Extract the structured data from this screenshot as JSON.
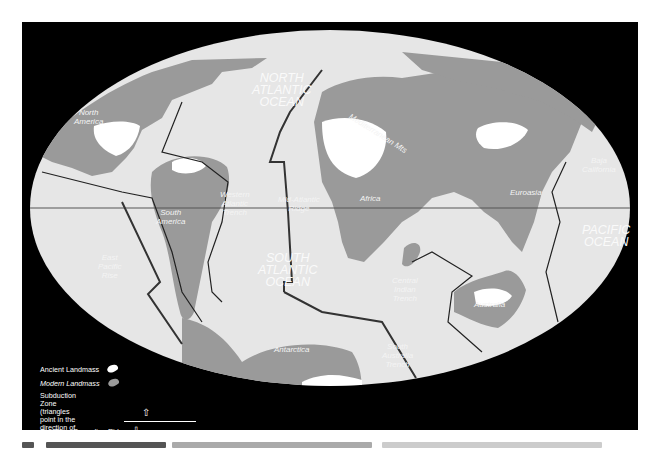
{
  "figure": {
    "type": "paleogeographic plate tectonic map",
    "colors": {
      "background": "#000000",
      "ocean": "#e6e6e6",
      "modern_landmass": "#9a9a9a",
      "ancient_landmass": "#ffffff",
      "lines": "#2a2a2a",
      "label_text": "#f4f4f4"
    }
  },
  "labels": {
    "north_america": "North\nAmerica",
    "south_america": "South\nAmerica",
    "africa": "Africa",
    "eurasia": "Euroasia",
    "mediterranean": "Mediterranean Mts",
    "baja_california": "Baja\nCalifornia",
    "australia": "Australia",
    "antarctica": "Antarctica",
    "western_atlantic_trench": "Western\nAtlantic\nTrench",
    "mid_atlantic_ridge": "Mid-Atlantic\nRidge",
    "east_pacific_rise": "East\nPacific\nRise",
    "central_indian_trench": "Central\nIndian\nTrench",
    "south_australia_trench": "South\nAustralia\nTrench"
  },
  "oceans": {
    "north_atlantic": "NORTH\nATLANTIC\nOCEAN",
    "south_atlantic": "SOUTH\nATLANTIC\nOCEAN",
    "pacific": "PACIFIC\nOCEAN"
  },
  "legend": {
    "ancient_landmass": "Ancient Landmass",
    "modern_landmass": "Modern Landmass",
    "subduction_zone": "Subduction Zone (triangles point in the\ndirection of subduction)",
    "spreading_ridge": "Sea Floor Spreading Ridge",
    "arrow_up_icon": "⇧",
    "arrow_down_icon": "⇩"
  }
}
